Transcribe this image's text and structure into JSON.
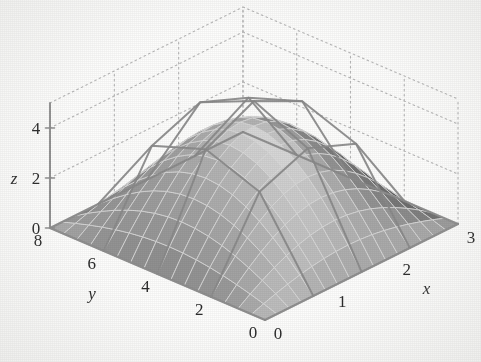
{
  "figure": {
    "kind": "3d-surface-plot",
    "background_color": "#fdfdfc",
    "render_style": "grayscale scanned textbook figure",
    "surface_description": "smooth shaded dome (fine mesh) with coarse wireframe tent overlay rising above it"
  },
  "axes": {
    "x": {
      "name": "x",
      "ticks": [
        "0",
        "1",
        "2",
        "3"
      ],
      "values": [
        0,
        1,
        2,
        3
      ],
      "min": 0,
      "max": 3,
      "direction": "increases toward lower-right"
    },
    "y": {
      "name": "y",
      "ticks": [
        "8",
        "6",
        "4",
        "2",
        "0"
      ],
      "values": [
        8,
        6,
        4,
        2,
        0
      ],
      "min": 0,
      "max": 8,
      "direction": "increases toward lower-left"
    },
    "z": {
      "name": "z",
      "ticks": [
        "0",
        "2",
        "4"
      ],
      "values": [
        0,
        2,
        4
      ],
      "min": 0,
      "max": 5,
      "direction": "vertical"
    }
  },
  "chart_data": {
    "type": "surface",
    "title": "",
    "xlabel": "x",
    "ylabel": "y",
    "zlabel": "z",
    "xlim": [
      0,
      3
    ],
    "ylim": [
      0,
      8
    ],
    "zlim": [
      0,
      5
    ],
    "xticks": [
      0,
      1,
      2,
      3
    ],
    "yticks": [
      0,
      2,
      4,
      6,
      8
    ],
    "zticks": [
      0,
      2,
      4
    ],
    "grid": true,
    "grid_style": "dotted",
    "legend": "none",
    "series": [
      {
        "name": "smooth-surface",
        "style": "shaded fine mesh dome",
        "mesh_nx": 16,
        "mesh_ny": 16,
        "peak_value": 4.0,
        "peak_at": {
          "x": 1.5,
          "y": 4.0
        },
        "baseline": 0,
        "shading": "grayscale, light near apex, dark near base skirt"
      },
      {
        "name": "coarse-wireframe",
        "style": "line mesh tent above surface",
        "mesh_nx": 4,
        "mesh_ny": 4,
        "peak_value": 5.0,
        "peak_at": {
          "x": 1.5,
          "y": 4.0
        },
        "baseline": 0
      }
    ]
  },
  "colors": {
    "background": "#fdfdfc",
    "axis_line": "#8f8f8f",
    "grid_dotted": "#b9b9b9",
    "tick_text": "#2b2b2b",
    "surface_light": "#cfcfcf",
    "surface_mid": "#9a9a9a",
    "surface_dark": "#4a4a4a",
    "mesh_line": "#d8d8d8",
    "wireframe_line": "#8a8a8a"
  }
}
